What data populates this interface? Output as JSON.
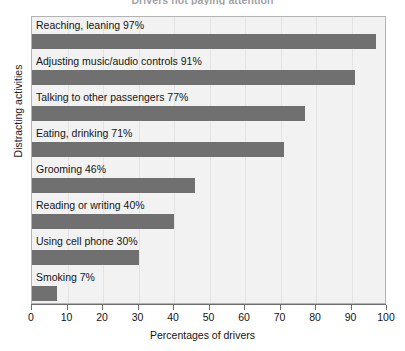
{
  "chart_data": {
    "type": "bar",
    "orientation": "horizontal",
    "title": "Drivers not paying attention",
    "xlabel": "Percentages of drivers",
    "ylabel": "Distracting activities",
    "xlim": [
      0,
      100
    ],
    "xticks": [
      0,
      10,
      20,
      30,
      40,
      50,
      60,
      70,
      80,
      90,
      100
    ],
    "grid": true,
    "legend": "none",
    "bar_color": "#707070",
    "plot_background": "#f2f2f2",
    "categories": [
      "Reaching, leaning",
      "Adjusting music/audio controls",
      "Talking to other passengers",
      "Eating, drinking",
      "Grooming",
      "Reading or writing",
      "Using cell phone",
      "Smoking"
    ],
    "values": [
      97,
      91,
      77,
      71,
      46,
      40,
      30,
      7
    ],
    "bars": [
      {
        "label": "Reaching, leaning 97%",
        "category": "Reaching, leaning",
        "value": 97
      },
      {
        "label": "Adjusting music/audio controls 91%",
        "category": "Adjusting music/audio controls",
        "value": 91
      },
      {
        "label": "Talking to other passengers 77%",
        "category": "Talking to other passengers",
        "value": 77
      },
      {
        "label": "Eating, drinking 71%",
        "category": "Eating, drinking",
        "value": 71
      },
      {
        "label": "Grooming 46%",
        "category": "Grooming",
        "value": 46
      },
      {
        "label": "Reading or writing 40%",
        "category": "Reading or writing",
        "value": 40
      },
      {
        "label": "Using cell phone 30%",
        "category": "Using cell phone",
        "value": 30
      },
      {
        "label": "Smoking 7%",
        "category": "Smoking",
        "value": 7
      }
    ]
  }
}
